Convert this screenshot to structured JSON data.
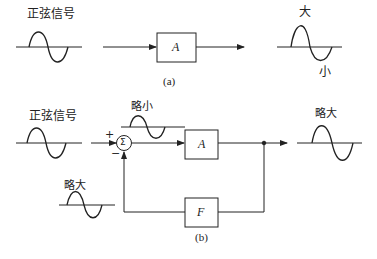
{
  "diagram_a": {
    "input_label": "正弦信号",
    "block_label": "A",
    "output_peak_label": "大",
    "output_trough_label": "小",
    "caption": "(a)"
  },
  "diagram_b": {
    "input_label": "正弦信号",
    "summing_symbol": "Σ",
    "plus_sign": "+",
    "minus_sign": "−",
    "error_signal_label": "略小",
    "forward_block_label": "A",
    "feedback_block_label": "F",
    "feedback_signal_label": "略大",
    "output_label": "略大",
    "caption": "(b)"
  },
  "colors": {
    "line": "#222222",
    "background": "#ffffff"
  }
}
